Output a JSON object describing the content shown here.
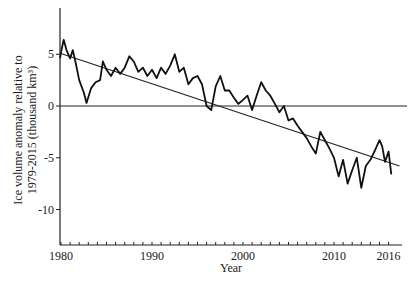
{
  "chart_data": {
    "type": "line",
    "title": "",
    "xlabel": "Year",
    "ylabel_line1": "Ice volume anomaly relative to",
    "ylabel_line2": "1979-2015 (thousand km³)",
    "xlim": [
      1979.9,
      2017.3
    ],
    "ylim": [
      -13.4,
      9.5
    ],
    "x_ticks": [
      1980,
      1990,
      2000,
      2010,
      2016
    ],
    "x_tick_labels": [
      "1980",
      "1990",
      "2000",
      "2010",
      "2016"
    ],
    "y_ticks": [
      5,
      0,
      -5,
      -10
    ],
    "y_tick_labels": [
      "5",
      "0",
      "-5",
      "-10"
    ],
    "grid": false,
    "legend": null,
    "zero_line": true,
    "series": [
      {
        "name": "Ice volume anomaly",
        "x": [
          1979.9,
          1980.0,
          1980.3,
          1980.6,
          1981.0,
          1981.3,
          1981.6,
          1982.0,
          1982.5,
          1982.8,
          1983.3,
          1983.8,
          1984.3,
          1984.6,
          1985.0,
          1985.5,
          1986.0,
          1986.5,
          1987.0,
          1987.5,
          1988.0,
          1988.5,
          1989.0,
          1989.5,
          1990.0,
          1990.5,
          1991.0,
          1991.5,
          1992.0,
          1992.5,
          1993.0,
          1993.5,
          1994.0,
          1994.5,
          1995.0,
          1995.5,
          1996.0,
          1996.5,
          1997.0,
          1997.5,
          1998.0,
          1998.5,
          1999.0,
          1999.5,
          2000.0,
          2000.5,
          2001.0,
          2001.5,
          2002.0,
          2002.5,
          2003.0,
          2003.5,
          2004.0,
          2004.5,
          2005.0,
          2005.5,
          2006.0,
          2006.5,
          2007.0,
          2007.5,
          2008.0,
          2008.5,
          2009.0,
          2009.5,
          2010.0,
          2010.5,
          2011.0,
          2011.5,
          2012.0,
          2012.5,
          2013.0,
          2013.5,
          2014.0,
          2014.5,
          2015.0,
          2015.3,
          2015.6,
          2016.0,
          2016.3
        ],
        "values": [
          4.6,
          5.2,
          6.4,
          5.4,
          4.6,
          5.4,
          4.2,
          2.5,
          1.3,
          0.3,
          1.7,
          2.3,
          2.5,
          4.3,
          3.5,
          2.9,
          3.7,
          3.1,
          3.7,
          4.8,
          4.3,
          3.3,
          3.7,
          2.9,
          3.5,
          2.7,
          3.7,
          3.1,
          3.9,
          5.0,
          3.3,
          3.7,
          2.1,
          2.7,
          2.9,
          2.1,
          0.0,
          -0.4,
          1.9,
          2.9,
          1.5,
          1.5,
          0.8,
          0.2,
          0.6,
          1.0,
          -0.4,
          1.0,
          2.3,
          1.5,
          1.0,
          0.2,
          -0.6,
          0.0,
          -1.4,
          -1.2,
          -1.9,
          -2.5,
          -3.1,
          -3.9,
          -4.6,
          -2.5,
          -3.3,
          -4.1,
          -5.0,
          -6.8,
          -5.2,
          -7.5,
          -6.2,
          -5.0,
          -7.9,
          -5.8,
          -5.2,
          -4.3,
          -3.3,
          -3.9,
          -5.4,
          -4.4,
          -6.6
        ]
      },
      {
        "name": "Linear trend",
        "x": [
          1979.9,
          2017.2
        ],
        "values": [
          5.1,
          -5.8
        ]
      }
    ]
  }
}
